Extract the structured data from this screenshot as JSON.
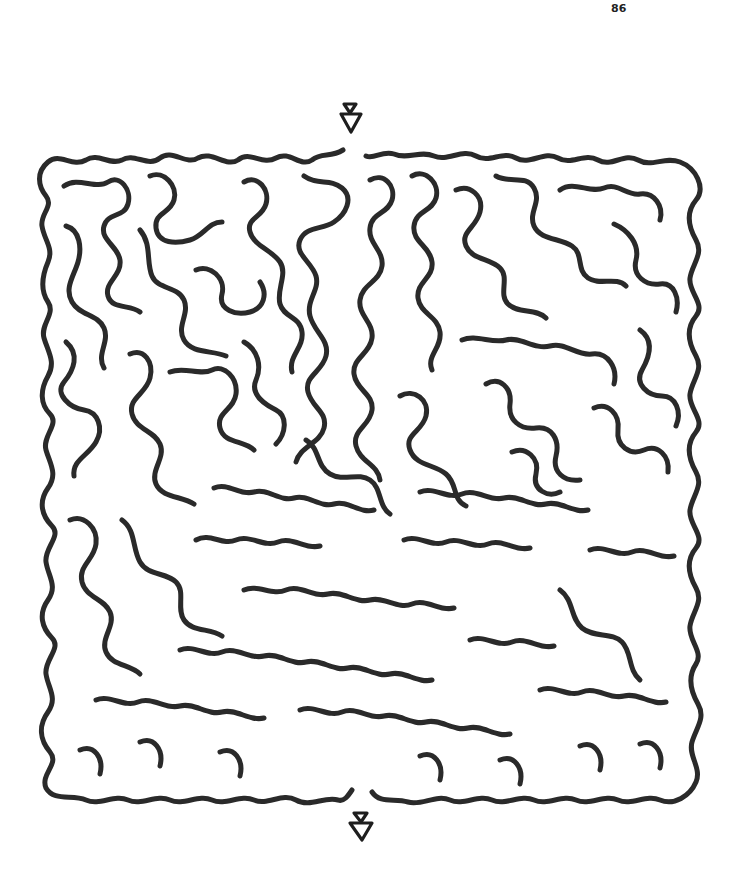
{
  "page": {
    "number": "86",
    "type": "maze puzzle"
  },
  "maze": {
    "shape": "square organic maze",
    "entrance": {
      "label": "start",
      "position": "top",
      "marker": "double-triangle-arrow-down"
    },
    "exit": {
      "label": "finish",
      "position": "bottom",
      "marker": "double-triangle-arrow-down"
    },
    "wall_color": "#2a2a2a",
    "background_color": "#ffffff"
  }
}
